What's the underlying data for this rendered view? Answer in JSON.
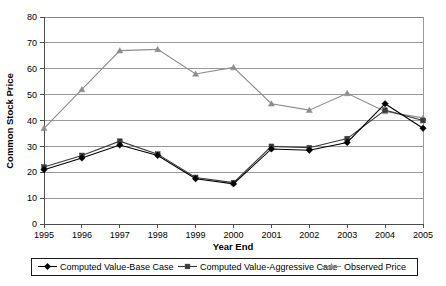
{
  "chart_data": {
    "type": "line",
    "title": "",
    "xlabel": "Year End",
    "ylabel": "Common Stock Price",
    "categories": [
      "1995",
      "1996",
      "1997",
      "1998",
      "1999",
      "2000",
      "2001",
      "2002",
      "2003",
      "2004",
      "2005"
    ],
    "ylim": [
      0,
      80
    ],
    "yticks": [
      0,
      10,
      20,
      30,
      40,
      50,
      60,
      70,
      80
    ],
    "ytick_labels": [
      "0",
      "10",
      "20",
      "30",
      "40",
      "50",
      "60",
      "70",
      "80"
    ],
    "grid": true,
    "legend_position": "bottom",
    "series": [
      {
        "name": "Computed Value-Base Case",
        "marker": "diamond",
        "color": "#000000",
        "values": [
          21.0,
          25.5,
          30.5,
          26.5,
          17.5,
          15.5,
          29.0,
          28.5,
          31.5,
          46.5,
          37.0
        ]
      },
      {
        "name": "Computed Value-Aggressive Case",
        "marker": "square",
        "color": "#3a3a3a",
        "values": [
          22.0,
          26.5,
          32.0,
          27.0,
          18.0,
          16.0,
          30.0,
          29.5,
          33.0,
          44.0,
          40.0
        ]
      },
      {
        "name": "Observed Price",
        "marker": "triangle",
        "color": "#8c8c8c",
        "values": [
          37.0,
          52.0,
          67.0,
          67.5,
          58.0,
          60.5,
          46.5,
          44.0,
          50.5,
          43.5,
          41.0
        ]
      }
    ]
  },
  "legend": {
    "items": [
      {
        "label": "Computed Value-Base Case"
      },
      {
        "label": "Computed Value-Aggressive Case"
      },
      {
        "label": "Observed Price"
      }
    ]
  },
  "axes": {
    "y_title": "Common Stock Price",
    "x_title": "Year End"
  }
}
